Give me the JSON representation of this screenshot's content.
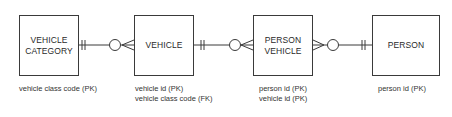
{
  "diagram": {
    "type": "entity-relationship",
    "notation": "crow's foot",
    "entities": [
      {
        "id": "vehicle-category",
        "name": "VEHICLE\nCATEGORY",
        "attributes": [
          "vehicle class code (PK)"
        ]
      },
      {
        "id": "vehicle",
        "name": "VEHICLE",
        "attributes": [
          "vehicle id (PK)",
          "vehicle class code (FK)"
        ]
      },
      {
        "id": "person-vehicle",
        "name": "PERSON\nVEHICLE",
        "attributes": [
          "person id (PK)",
          "vehicle id (PK)"
        ]
      },
      {
        "id": "person",
        "name": "PERSON",
        "attributes": [
          "person id (PK)"
        ]
      }
    ],
    "relationships": [
      {
        "from": "VEHICLE CATEGORY",
        "from_cardinality": "exactly one",
        "to": "VEHICLE",
        "to_cardinality": "zero or many"
      },
      {
        "from": "VEHICLE",
        "from_cardinality": "exactly one",
        "to": "PERSON VEHICLE",
        "to_cardinality": "zero or many"
      },
      {
        "from": "PERSON",
        "from_cardinality": "exactly one",
        "to": "PERSON VEHICLE",
        "to_cardinality": "zero or many"
      }
    ],
    "colors": {
      "line": "#3a3a3a",
      "text": "#2a2a2a",
      "background": "#ffffff"
    }
  }
}
